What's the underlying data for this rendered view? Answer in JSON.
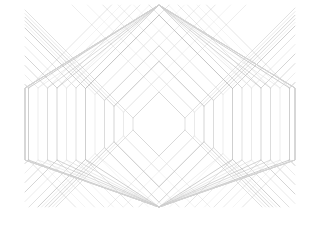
{
  "artwork": {
    "title": "Concentric Hexagon Line Pattern",
    "type": "generative-line-art",
    "canvas": {
      "width": 318,
      "height": 233,
      "background": "#ffffff"
    },
    "frame": {
      "left": 25,
      "top": 5,
      "right": 295,
      "bottom": 207
    },
    "center": {
      "x": 159,
      "y": 124
    },
    "stroke": {
      "color": "#c9c9c9",
      "color_light": "#dedede",
      "color_dark": "#b4b4b4",
      "width": 0.7
    },
    "geometry": {
      "shape": "hexagon",
      "ring_count": 17,
      "ring_step_px": 9.5,
      "diagonal_angle_deg": 45,
      "side_vertical_half_height": 36,
      "description": "Concentric hexagons with 45-degree diagonal upper and lower edges joined by vertical left and right edges. Each ring's diagonals are extended as straight rays to the frame boundary, producing a crosshatch moire band above the top vertices."
    },
    "innermost_ring": {
      "half_width": 26,
      "half_height_total": 20
    },
    "crosshatch_band": {
      "x_start": 100,
      "x_end": 220,
      "y_start": 5,
      "y_end": 85,
      "note": "Region where left-leaning and right-leaning extended diagonals overlap"
    }
  }
}
